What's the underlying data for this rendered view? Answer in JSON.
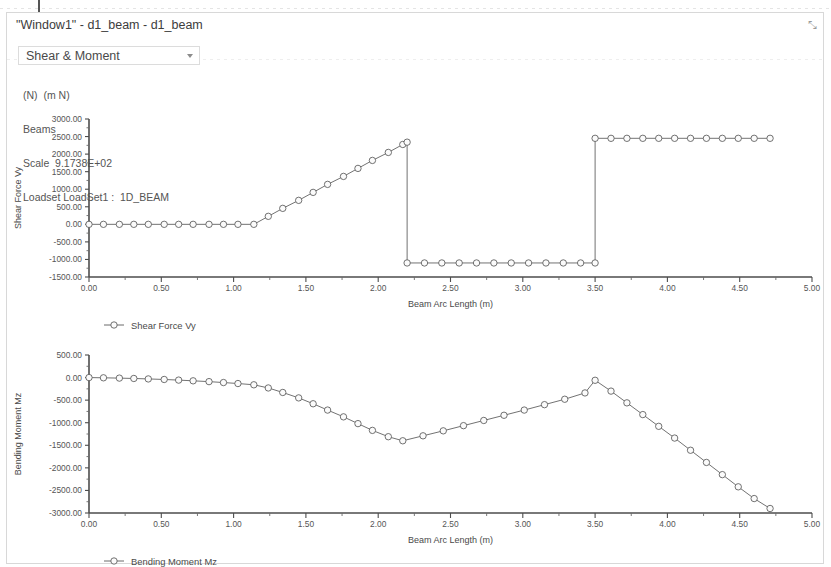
{
  "window": {
    "title": "\"Window1\" - d1_beam - d1_beam",
    "resize_glyph": "⤡"
  },
  "toolbar": {
    "quantity_selected": "Shear & Moment",
    "quantity_options": [
      "Shear & Moment"
    ]
  },
  "info": {
    "units": "(N)  (m N)",
    "entity": "Beams",
    "scale": "Scale  9.1738E+02",
    "loadset": "Loadset LoadSet1 :  1D_BEAM"
  },
  "chart_data": [
    {
      "id": "shear",
      "type": "line",
      "title": "",
      "xlabel": "Beam Arc Length (m)",
      "ylabel": "Shear Force  Vy",
      "legend": "Shear Force  Vy",
      "legend_position": "below-left",
      "grid": false,
      "markers": "circle",
      "xlim": [
        0.0,
        5.0
      ],
      "ylim": [
        -1500.0,
        3000.0
      ],
      "xticks": [
        0.0,
        0.5,
        1.0,
        1.5,
        2.0,
        2.5,
        3.0,
        3.5,
        4.0,
        4.5,
        5.0
      ],
      "xticklabels": [
        "0.00",
        "0.50",
        "1.00",
        "1.50",
        "2.00",
        "2.50",
        "3.00",
        "3.50",
        "4.00",
        "4.50",
        "5.00"
      ],
      "yticks": [
        -1500,
        -1000,
        -500,
        0,
        500,
        1000,
        1500,
        2000,
        2500,
        3000
      ],
      "yticklabels": [
        "-1500.00",
        "-1000.00",
        "-500.00",
        "0.00",
        "500.00",
        "1000.00",
        "1500.00",
        "2000.00",
        "2500.00",
        "3000.00"
      ],
      "x": [
        0.0,
        0.1,
        0.21,
        0.31,
        0.41,
        0.52,
        0.62,
        0.72,
        0.83,
        0.93,
        1.03,
        1.14,
        1.24,
        1.34,
        1.45,
        1.55,
        1.65,
        1.76,
        1.86,
        1.96,
        2.07,
        2.17,
        2.2,
        2.2,
        2.32,
        2.44,
        2.56,
        2.68,
        2.8,
        2.92,
        3.04,
        3.16,
        3.28,
        3.4,
        3.5,
        3.5,
        3.61,
        3.72,
        3.83,
        3.94,
        4.05,
        4.16,
        4.27,
        4.38,
        4.49,
        4.6,
        4.71
      ],
      "y": [
        0,
        0,
        0,
        0,
        0,
        0,
        0,
        0,
        0,
        0,
        0,
        0,
        228,
        455,
        683,
        910,
        1138,
        1365,
        1593,
        1820,
        2048,
        2275,
        2340,
        -1100,
        -1100,
        -1100,
        -1100,
        -1100,
        -1100,
        -1100,
        -1100,
        -1100,
        -1100,
        -1100,
        -1100,
        2450,
        2450,
        2450,
        2450,
        2450,
        2450,
        2450,
        2450,
        2450,
        2450,
        2450,
        2450
      ],
      "peak_value": 2500,
      "plateau_negative": -1100,
      "plateau_positive": 2450
    },
    {
      "id": "moment",
      "type": "line",
      "title": "",
      "xlabel": "Beam Arc Length (m)",
      "ylabel": "Bending Moment  Mz",
      "legend": "Bending Moment  Mz",
      "legend_position": "below-left",
      "grid": false,
      "markers": "circle",
      "xlim": [
        0.0,
        5.0
      ],
      "ylim": [
        -3000.0,
        500.0
      ],
      "xticks": [
        0.0,
        0.5,
        1.0,
        1.5,
        2.0,
        2.5,
        3.0,
        3.5,
        4.0,
        4.5,
        5.0
      ],
      "xticklabels": [
        "0.00",
        "0.50",
        "1.00",
        "1.50",
        "2.00",
        "2.50",
        "3.00",
        "3.50",
        "4.00",
        "4.50",
        "5.00"
      ],
      "yticks": [
        -3000,
        -2500,
        -2000,
        -1500,
        -1000,
        -500,
        0,
        500
      ],
      "yticklabels": [
        "-3000.00",
        "-2500.00",
        "-2000.00",
        "-1500.00",
        "-1000.00",
        "-500.00",
        "0.00",
        "500.00"
      ],
      "x": [
        0.0,
        0.1,
        0.21,
        0.31,
        0.41,
        0.52,
        0.62,
        0.72,
        0.83,
        0.93,
        1.03,
        1.14,
        1.24,
        1.34,
        1.45,
        1.55,
        1.65,
        1.76,
        1.86,
        1.96,
        2.07,
        2.17,
        2.31,
        2.45,
        2.59,
        2.73,
        2.87,
        3.01,
        3.15,
        3.29,
        3.43,
        3.5,
        3.61,
        3.72,
        3.83,
        3.94,
        4.05,
        4.16,
        4.27,
        4.38,
        4.49,
        4.6,
        4.71
      ],
      "y": [
        0,
        -5,
        -12,
        -20,
        -30,
        -42,
        -56,
        -72,
        -90,
        -110,
        -132,
        -160,
        -230,
        -330,
        -450,
        -580,
        -720,
        -870,
        -1020,
        -1170,
        -1310,
        -1400,
        -1290,
        -1180,
        -1065,
        -950,
        -835,
        -720,
        -600,
        -480,
        -340,
        -60,
        -300,
        -560,
        -820,
        -1080,
        -1340,
        -1610,
        -1880,
        -2150,
        -2420,
        -2680,
        -2900
      ],
      "min_value": -1400,
      "local_max_value": -60,
      "end_value": -2900
    }
  ]
}
